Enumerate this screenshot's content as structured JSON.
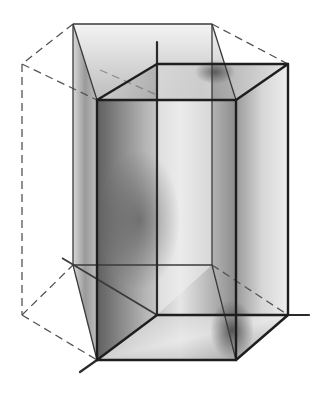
{
  "figure": {
    "colors": {
      "background": "#ffffff",
      "edge": "#1e1e1e",
      "dashed_edge": "#555555",
      "shade_dark": "#5a5a5a",
      "shade_light": "#e8e8e8"
    },
    "solid_box": {
      "top_face": [
        [
          97,
          100
        ],
        [
          236,
          100
        ],
        [
          288,
          64
        ],
        [
          157,
          64
        ]
      ],
      "bottom_face": [
        [
          97,
          360
        ],
        [
          236,
          360
        ],
        [
          288,
          315
        ],
        [
          157,
          315
        ]
      ]
    },
    "outer_prism": {
      "top_back": [
        [
          73,
          24
        ],
        [
          212,
          24
        ]
      ],
      "left_far": [
        [
          22,
          64
        ],
        [
          22,
          315
        ]
      ],
      "bottom_back": [
        [
          73,
          265
        ],
        [
          212,
          265
        ]
      ]
    },
    "axes": {
      "bottom_left_stub": [
        [
          80,
          372
        ],
        [
          97,
          360
        ]
      ],
      "right_stub": [
        [
          288,
          315
        ],
        [
          309,
          315
        ]
      ],
      "left_diagonal": [
        [
          62,
          258
        ],
        [
          157,
          315
        ]
      ]
    }
  }
}
